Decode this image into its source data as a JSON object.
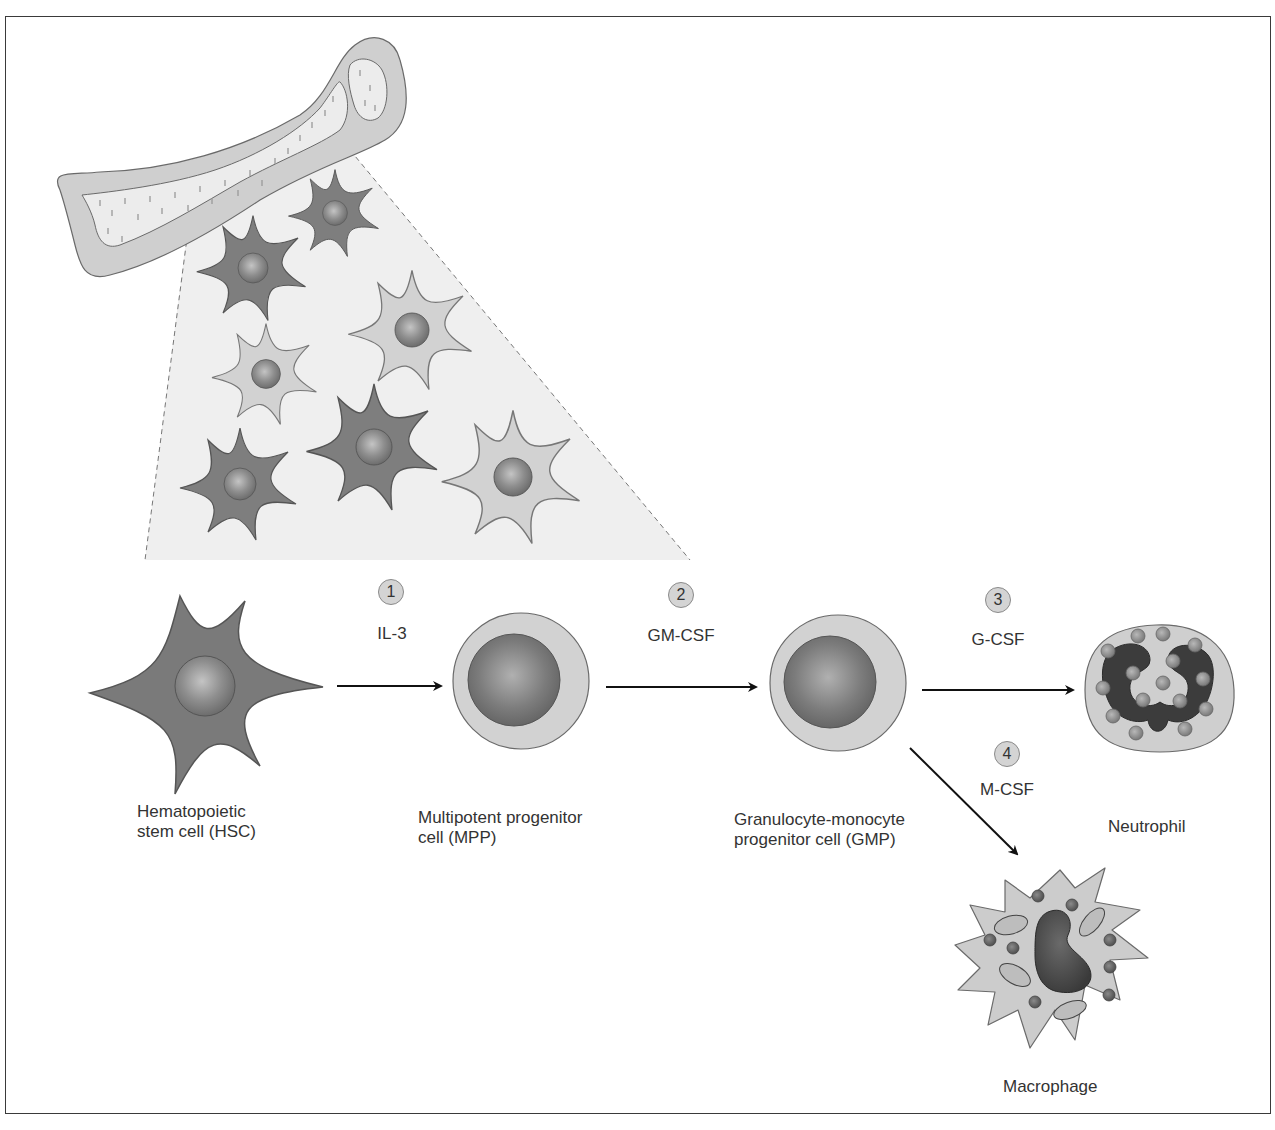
{
  "figure": {
    "source_region": "Bone marrow (bone cross-section with stem cell population)"
  },
  "cells": [
    {
      "id": "hsc",
      "label_line1": "Hematopoietic",
      "label_line2": "stem cell (HSC)"
    },
    {
      "id": "mpp",
      "label_line1": "Multipotent progenitor",
      "label_line2": "cell (MPP)"
    },
    {
      "id": "gmp",
      "label_line1": "Granulocyte-monocyte",
      "label_line2": "progenitor cell (GMP)"
    },
    {
      "id": "neutrophil",
      "label_line1": "Neutrophil"
    },
    {
      "id": "macrophage",
      "label_line1": "Macrophage"
    }
  ],
  "steps": [
    {
      "number": "1",
      "factor": "IL-3",
      "from": "hsc",
      "to": "mpp"
    },
    {
      "number": "2",
      "factor": "GM-CSF",
      "from": "mpp",
      "to": "gmp"
    },
    {
      "number": "3",
      "factor": "G-CSF",
      "from": "gmp",
      "to": "neutrophil"
    },
    {
      "number": "4",
      "factor": "M-CSF",
      "from": "gmp",
      "to": "macrophage"
    }
  ],
  "colors": {
    "cell_dark": "#7a7a7a",
    "cell_light": "#d2d2d2",
    "nucleus": "#8c8c8c",
    "bone_outer": "#cfcfcf",
    "marrow": "#ececec",
    "zoom_cone": "#efefef",
    "arrow": "#111111"
  }
}
